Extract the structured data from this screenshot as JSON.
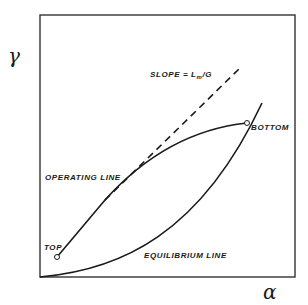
{
  "diagram": {
    "y_axis_symbol": "γ",
    "x_axis_symbol": "α",
    "labels": {
      "slope_prefix": "SLOPE = L",
      "slope_sub": "m",
      "slope_suffix": "/G",
      "bottom": "BOTTOM",
      "operating_line": "OPERATING LINE",
      "top": "TOP",
      "equilibrium_line": "EQUILIBRIUM LINE"
    },
    "colors": {
      "line": "#1a1a1a",
      "background": "#ffffff"
    }
  }
}
